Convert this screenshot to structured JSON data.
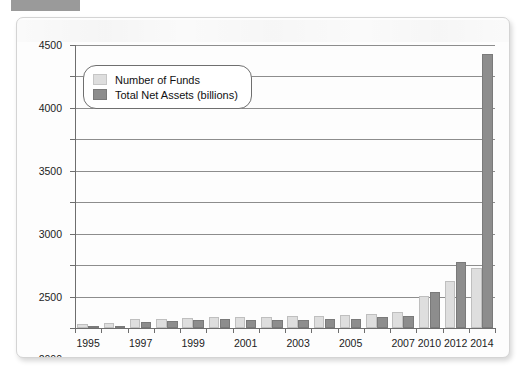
{
  "corner_tag": {
    "name": "redacted-label",
    "color": "#9a9a9a"
  },
  "colors": {
    "funds": "#dedede",
    "assets": "#8d8d8d",
    "axis": "#6e6e6e",
    "grid": "#8d8d8d",
    "card_background": "#fdfdfd"
  },
  "legend": {
    "position": "top-left-inside-plot",
    "entries": [
      {
        "label": "Number of Funds",
        "color": "#dedede",
        "swatch": "funds-swatch"
      },
      {
        "label": "Total Net Assets (billions)",
        "color": "#8d8d8d",
        "swatch": "assets-swatch"
      }
    ]
  },
  "chart_data": {
    "type": "bar",
    "title": "",
    "xlabel": "",
    "ylabel": "",
    "ylim": [
      0,
      4500
    ],
    "ytick_step": 500,
    "ytick_labels": [
      "0",
      "500",
      "1000",
      "1500",
      "2000",
      "2500",
      "3000",
      "3500",
      "4000",
      "4500"
    ],
    "grid": true,
    "legend_position": "upper left",
    "categories": [
      "1995",
      "1996",
      "1997",
      "1998",
      "1999",
      "2000",
      "2001",
      "2002",
      "2003",
      "2004",
      "2005",
      "2006",
      "2007",
      "2010",
      "2012",
      "2014"
    ],
    "tick_labels_shown": [
      "1995",
      "1997",
      "1999",
      "2001",
      "2003",
      "2005",
      "2007",
      "2010",
      "2012",
      "2014"
    ],
    "series": [
      {
        "name": "Number of Funds",
        "color": "#dedede",
        "values": [
          60,
          85,
          145,
          150,
          160,
          170,
          175,
          180,
          185,
          195,
          200,
          220,
          250,
          510,
          750,
          960
        ]
      },
      {
        "name": "Total Net Assets (billions)",
        "color": "#8d8d8d",
        "values": [
          10,
          30,
          95,
          105,
          130,
          140,
          135,
          120,
          130,
          140,
          150,
          175,
          195,
          570,
          1050,
          4350
        ]
      }
    ]
  }
}
